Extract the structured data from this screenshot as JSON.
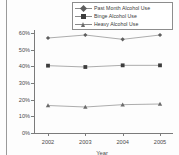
{
  "figure": {
    "background_color": "#fdfdfd",
    "line_color": "#8a8a8a",
    "axis_color": "#7b7b7b",
    "text_color": "#4a4a4a"
  },
  "legend": {
    "position": "top-right",
    "entries": [
      {
        "label": "Past Month Alcohol Use",
        "marker": "diamond",
        "color": "#5e5e5e"
      },
      {
        "label": "Binge Alcohol Use",
        "marker": "square",
        "color": "#3d3d3d"
      },
      {
        "label": "Heavy Alcohol Use",
        "marker": "triangle",
        "color": "#6b6b6b"
      }
    ]
  },
  "axes": {
    "y_ticks": [
      "60%",
      "50%",
      "40%",
      "30%",
      "20%",
      "10%",
      "0%"
    ],
    "x_ticks": [
      "2002",
      "2003",
      "2004",
      "2005"
    ],
    "x_title": "Year",
    "y_title": ""
  },
  "chart_data": {
    "type": "line",
    "title": "",
    "xlabel": "Year",
    "ylabel": "",
    "categories": [
      "2002",
      "2003",
      "2004",
      "2005"
    ],
    "x": [
      2002,
      2003,
      2004,
      2005
    ],
    "ylim": [
      0,
      60
    ],
    "y_tick_values": [
      0,
      10,
      20,
      30,
      40,
      50,
      60
    ],
    "y_tick_labels": [
      "0%",
      "10%",
      "20%",
      "30%",
      "40%",
      "50%",
      "60%"
    ],
    "grid": false,
    "legend_position": "top-right",
    "units": "percent",
    "series": [
      {
        "name": "Past Month Alcohol Use",
        "marker": "diamond",
        "color": "#5e5e5e",
        "values": [
          57.0,
          58.8,
          56.2,
          58.8
        ]
      },
      {
        "name": "Binge Alcohol Use",
        "marker": "square",
        "color": "#3d3d3d",
        "values": [
          40.4,
          39.6,
          40.6,
          40.6
        ]
      },
      {
        "name": "Heavy Alcohol Use",
        "marker": "triangle",
        "color": "#6b6b6b",
        "values": [
          16.5,
          15.6,
          17.0,
          17.4
        ]
      }
    ]
  }
}
